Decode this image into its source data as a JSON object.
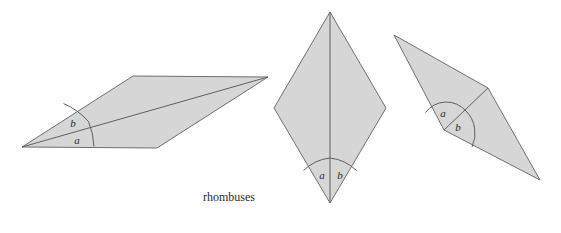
{
  "figure": {
    "caption": "rhombuses",
    "caption_x": 229,
    "caption_y": 198,
    "background_color": "#ffffff",
    "fill_color": "#d6d6d6",
    "stroke_color": "#6f6f6f",
    "label_color": "#2b2b2b",
    "width": 561,
    "height": 233
  },
  "shapes": [
    {
      "id": "rhombus-left",
      "name": "flat-wide-rhombus",
      "points": "22,147 157,148 268,77 133,76",
      "diagonal": {
        "x1": 22,
        "y1": 147,
        "x2": 268,
        "y2": 77
      },
      "arcs": [
        {
          "id": "arc-a",
          "d": "M 94,146.5 A 72,72 0 0 0 88.5,121.5"
        },
        {
          "id": "arc-b",
          "d": "M 88.5,121.5 A 72,72 0 0 0 63.5,103.5"
        }
      ],
      "labels": [
        {
          "id": "label-a",
          "text": "a",
          "x": 77,
          "y": 141
        },
        {
          "id": "label-b",
          "text": "b",
          "x": 73,
          "y": 124
        }
      ]
    },
    {
      "id": "rhombus-middle",
      "name": "upright-diamond-rhombus",
      "points": "330,12 386,108 330,203 274,108",
      "diagonal": {
        "x1": 330,
        "y1": 12,
        "x2": 330,
        "y2": 203
      },
      "arcs": [
        {
          "id": "arc-a",
          "d": "M 303.5,170.5 A 45,45 0 0 1 330,158"
        },
        {
          "id": "arc-b",
          "d": "M 330,158 A 45,45 0 0 1 356.5,170.5"
        }
      ],
      "labels": [
        {
          "id": "label-a",
          "text": "a",
          "x": 322,
          "y": 176
        },
        {
          "id": "label-b",
          "text": "b",
          "x": 340,
          "y": 176
        }
      ]
    },
    {
      "id": "rhombus-right",
      "name": "tilted-slim-rhombus",
      "points": "394,35 488,88 540,180 444,130",
      "diagonal": {
        "x1": 444,
        "y1": 130,
        "x2": 488,
        "y2": 88
      },
      "arcs": [
        {
          "id": "arc-a",
          "d": "M 425.5,112.5 A 26,26 0 0 1 466,111"
        },
        {
          "id": "arc-b",
          "d": "M 466,111 A 32,32 0 0 1 472,147"
        }
      ],
      "labels": [
        {
          "id": "label-a",
          "text": "a",
          "x": 443,
          "y": 114
        },
        {
          "id": "label-b",
          "text": "b",
          "x": 458,
          "y": 128
        }
      ]
    }
  ]
}
